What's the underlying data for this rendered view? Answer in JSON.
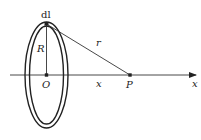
{
  "diagram": {
    "type": "physics-circular-current-loop-axis-field",
    "colors": {
      "stroke": "#222222",
      "background": "#ffffff"
    },
    "labels": {
      "element": "dl",
      "radius": "R",
      "distance": "r",
      "center": "O",
      "point": "P",
      "offset": "x",
      "axis": "x"
    },
    "geometry": {
      "center": [
        46.5,
        75
      ],
      "outer_ellipse": {
        "rx": 21.5,
        "ry": 53
      },
      "inner_ellipse": {
        "rx": 17,
        "ry": 49
      },
      "dl_point": [
        46,
        24
      ],
      "p_point": [
        130,
        75
      ],
      "axis_start": [
        10,
        75
      ],
      "axis_end": [
        197,
        75
      ]
    }
  }
}
